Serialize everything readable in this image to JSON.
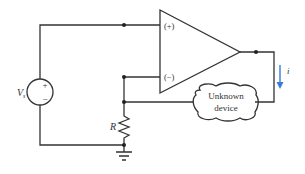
{
  "diagram": {
    "source": {
      "label": "V",
      "subscript": "s",
      "plus": "+",
      "minus": "−"
    },
    "opamp": {
      "noninverting": "(+)",
      "inverting": "(−)"
    },
    "resistor": {
      "label": "R"
    },
    "load": {
      "line1": "Unknown",
      "line2": "device"
    },
    "current": {
      "label": "i",
      "arrow_color": "#3a7bd5"
    },
    "wire_color": "#333333"
  }
}
